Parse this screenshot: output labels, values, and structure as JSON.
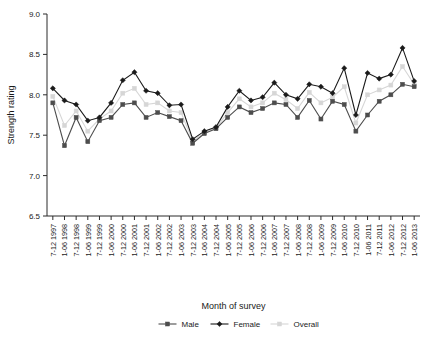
{
  "chart_data": {
    "type": "line",
    "title": "",
    "xlabel": "Month of survey",
    "ylabel": "Strength rating",
    "ylim": [
      6.5,
      9.0
    ],
    "ytick_labels": [
      "6.5",
      "7.0",
      "7.5",
      "8.0",
      "8.5",
      "9.0"
    ],
    "ytick_values": [
      6.5,
      7.0,
      7.5,
      8.0,
      8.5,
      9.0
    ],
    "grid": false,
    "legend_position": "bottom",
    "categories": [
      "7-12 1997",
      "1-06 1998",
      "7-12 1998",
      "1-06 1999",
      "7-12 1999",
      "1-06 2000",
      "7-12 2000",
      "1-06 2001",
      "7-12 2001",
      "1-06 2002",
      "7-12 2002",
      "1-06 2003",
      "7-12 2003",
      "1-06 2004",
      "7-12 2004",
      "1-06 2005",
      "7-12 2005",
      "1-06 2006",
      "7-12 2006",
      "1-06 2007",
      "7-12 2007",
      "1-06 2008",
      "7-12 2008",
      "1-06 2009",
      "7-12 2009",
      "1-06 2010",
      "7-12 2010",
      "1-06 2011",
      "7-12 2011",
      "1-06 2012",
      "7-12 2012",
      "1-06 2013"
    ],
    "series": [
      {
        "name": "Male",
        "color": "#4d4d4d",
        "marker": "square",
        "values": [
          7.9,
          7.37,
          7.72,
          7.42,
          7.68,
          7.72,
          7.88,
          7.9,
          7.72,
          7.78,
          7.73,
          7.68,
          7.4,
          7.52,
          7.58,
          7.72,
          7.85,
          7.78,
          7.83,
          7.9,
          7.88,
          7.72,
          7.93,
          7.7,
          7.92,
          7.88,
          7.55,
          7.75,
          7.92,
          8.0,
          8.13,
          8.1
        ]
      },
      {
        "name": "Female",
        "color": "#1a1a1a",
        "marker": "diamond",
        "values": [
          8.08,
          7.93,
          7.88,
          7.68,
          7.72,
          7.9,
          8.18,
          8.28,
          8.05,
          8.02,
          7.87,
          7.88,
          7.45,
          7.55,
          7.6,
          7.85,
          8.05,
          7.93,
          7.97,
          8.15,
          8.0,
          7.95,
          8.13,
          8.1,
          8.02,
          8.33,
          7.75,
          8.27,
          8.2,
          8.25,
          8.58,
          8.17
        ]
      },
      {
        "name": "Overall",
        "color": "#d6d6d6",
        "marker": "square",
        "values": [
          7.98,
          7.62,
          7.8,
          7.55,
          7.7,
          7.8,
          8.02,
          8.08,
          7.88,
          7.9,
          7.8,
          7.78,
          7.43,
          7.53,
          7.59,
          7.78,
          7.95,
          7.85,
          7.9,
          8.02,
          7.94,
          7.83,
          8.03,
          7.9,
          7.97,
          8.1,
          7.65,
          8.0,
          8.06,
          8.12,
          8.35,
          8.13
        ]
      }
    ]
  }
}
